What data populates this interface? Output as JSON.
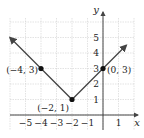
{
  "chart_data": {
    "type": "line",
    "title": "",
    "xlabel": "x",
    "ylabel": "y",
    "xlim": [
      -6,
      2
    ],
    "ylim": [
      -1,
      6
    ],
    "grid": true,
    "x_ticks": [
      "-5",
      "-4",
      "-3",
      "-2",
      "-1",
      "1"
    ],
    "y_ticks": [
      "1",
      "2",
      "3",
      "4",
      "5"
    ],
    "series": [
      {
        "name": "y = |x + 2| + 1",
        "x": [
          -6,
          -4,
          -2,
          0,
          1.5
        ],
        "y": [
          5,
          3,
          1,
          3,
          4.5
        ],
        "arrows_at_ends": true
      }
    ],
    "points": [
      {
        "x": -4,
        "y": 3,
        "label": "(−4, 3)"
      },
      {
        "x": -2,
        "y": 1,
        "label": "(−2, 1)"
      },
      {
        "x": 0,
        "y": 3,
        "label": "(0, 3)"
      }
    ],
    "colors": {
      "line": "#444444",
      "grid": "#d0d0d0",
      "axis": "#333333",
      "point": "#111111"
    }
  }
}
